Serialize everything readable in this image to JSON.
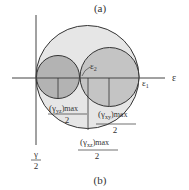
{
  "figure": {
    "label_top": "(a)",
    "label_bottom": "(b)",
    "x_axis_label": "ε",
    "y_axis_label_num": "γ",
    "y_axis_label_den": "2",
    "point_labels": {
      "eps1": "ε",
      "eps1_sub": "1",
      "eps2": "ε",
      "eps2_sub": "2"
    },
    "radius_labels": [
      {
        "name": "gamma-yz-max-half",
        "symbol": "(γ",
        "sub": "yz",
        "suffix": ")max",
        "den": "2"
      },
      {
        "name": "gamma-xy-max-half",
        "symbol": "(γ",
        "sub": "xy",
        "suffix": ")max",
        "den": "2"
      },
      {
        "name": "gamma-xz-max-half",
        "symbol": "(γ",
        "sub": "xz",
        "suffix": ")max",
        "den": "2"
      }
    ],
    "colors": {
      "large_circle_fill": "#e6e6e6",
      "small_circle_fill": "#b3b3b3",
      "stroke": "#333333"
    }
  }
}
